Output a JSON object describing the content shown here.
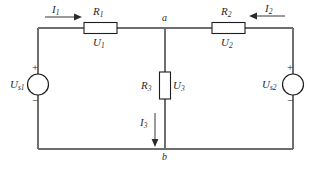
{
  "diagram": {
    "colors": {
      "wire": "#6e6e6e",
      "component_outline": "#1d1d1d",
      "text": "#2b2b2b",
      "background": "#ffffff"
    },
    "resistors": [
      {
        "name": "R1",
        "label": "R",
        "subscript": "1",
        "voltage_label": "U",
        "voltage_subscript": "1",
        "orientation": "horizontal"
      },
      {
        "name": "R2",
        "label": "R",
        "subscript": "2",
        "voltage_label": "U",
        "voltage_subscript": "2",
        "orientation": "horizontal"
      },
      {
        "name": "R3",
        "label": "R",
        "subscript": "3",
        "voltage_label": "U",
        "voltage_subscript": "3",
        "orientation": "vertical"
      }
    ],
    "sources": [
      {
        "name": "Us1",
        "label": "U",
        "subscript": "s1",
        "plus": "+",
        "minus": "−",
        "position": "left"
      },
      {
        "name": "Us2",
        "label": "U",
        "subscript": "s2",
        "plus": "+",
        "minus": "−",
        "position": "right"
      }
    ],
    "currents": [
      {
        "name": "I1",
        "label": "I",
        "subscript": "1",
        "direction": "right"
      },
      {
        "name": "I2",
        "label": "I",
        "subscript": "2",
        "direction": "left"
      },
      {
        "name": "I3",
        "label": "I",
        "subscript": "3",
        "direction": "down"
      }
    ],
    "nodes": [
      {
        "name": "a",
        "label": "a",
        "position": "top-center"
      },
      {
        "name": "b",
        "label": "b",
        "position": "bottom-center"
      }
    ]
  }
}
